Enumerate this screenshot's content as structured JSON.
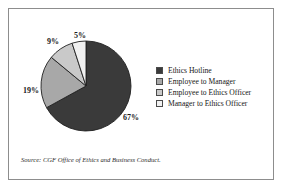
{
  "chart_data": {
    "type": "pie",
    "title": "",
    "subtitle": "",
    "xlabel": "",
    "ylabel": "",
    "grid": false,
    "legend_position": "right",
    "start_angle_deg": 0,
    "direction": "clockwise",
    "categories": [
      "Ethics Hotline",
      "Employee to Manager",
      "Employee to Ethics Officer",
      "Manager to Ethics Officer"
    ],
    "values": [
      67,
      19,
      9,
      5
    ],
    "value_unit": "%",
    "data_labels": [
      "67%",
      "19%",
      "9%",
      "5%"
    ],
    "colors": [
      "#3a3a3a",
      "#a8a8a8",
      "#c9c9c9",
      "#f1f1f1"
    ],
    "slice_outline_color": "#1f1f1f",
    "annotations": [
      "Source: CGF Office of Ethics and Business Conduct."
    ]
  },
  "figure": {
    "frame_border_color": "#8d8d8d",
    "background": "#ffffff",
    "source_note": "Source: CGF Office of Ethics and Business Conduct."
  },
  "slice_labels": {
    "hotline": "67%",
    "manager": "19%",
    "ethics_officer": "9%",
    "manager_to_ethics_officer": "5%"
  },
  "legend": {
    "items": [
      {
        "label": "Ethics Hotline",
        "color": "#3a3a3a"
      },
      {
        "label": "Employee to Manager",
        "color": "#a8a8a8"
      },
      {
        "label": "Employee to Ethics Officer",
        "color": "#c9c9c9"
      },
      {
        "label": "Manager to Ethics Officer",
        "color": "#f1f1f1"
      }
    ]
  }
}
